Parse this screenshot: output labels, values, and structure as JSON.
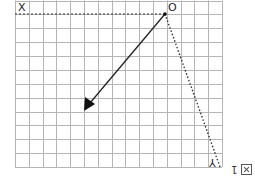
{
  "diagram": {
    "grid": {
      "cols": 15,
      "rows": 12,
      "color": "#b5b5b5"
    },
    "labels": {
      "x": "X",
      "o": "O",
      "y": "Y"
    },
    "caption": {
      "number": "1",
      "icon": "figure-box-icon"
    },
    "colors": {
      "line": "#222222",
      "grid": "#b5b5b5"
    }
  }
}
